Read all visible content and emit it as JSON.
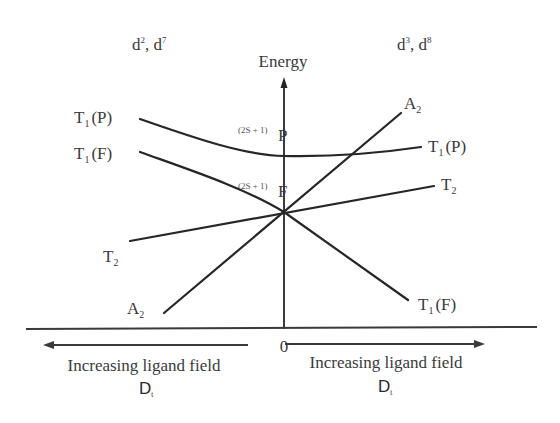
{
  "diagram": {
    "title_energy": "Energy",
    "left_config": {
      "base": "d",
      "sup1": "2",
      "sep": ", ",
      "base2": "d",
      "sup2": "7"
    },
    "right_config": {
      "base": "d",
      "sup1": "3",
      "sep": ", ",
      "base2": "d",
      "sup2": "8"
    },
    "free_ion_terms": [
      {
        "prefix": "(2S + 1)",
        "term": "P"
      },
      {
        "prefix": "(2S + 1)",
        "term": "F"
      }
    ],
    "origin_label": "0",
    "x_axis": {
      "left_label": "Increasing ligand field",
      "left_symbol": "D",
      "left_symbol_sub": "t",
      "right_label": "Increasing ligand field",
      "right_symbol": "D",
      "right_symbol_sub": "t"
    },
    "left_states": [
      {
        "main": "T",
        "sub": "1",
        "suffix": "(P)"
      },
      {
        "main": "T",
        "sub": "1",
        "suffix": "(F)"
      },
      {
        "main": "T",
        "sub": "2",
        "suffix": ""
      },
      {
        "main": "A",
        "sub": "2",
        "suffix": ""
      }
    ],
    "right_states": [
      {
        "main": "A",
        "sub": "2",
        "suffix": ""
      },
      {
        "main": "T",
        "sub": "1",
        "suffix": "(P)"
      },
      {
        "main": "T",
        "sub": "2",
        "suffix": ""
      },
      {
        "main": "T",
        "sub": "1",
        "suffix": "(F)"
      }
    ],
    "line_color": "#262626",
    "text_color": "#3a3a3a"
  }
}
